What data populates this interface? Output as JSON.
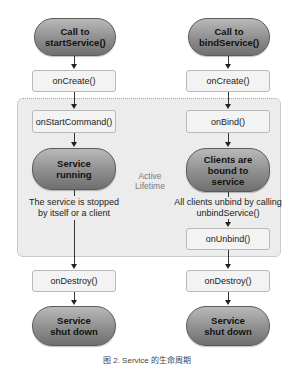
{
  "diagram": {
    "region_label": "Active\nLifetime",
    "left": {
      "start": "Call to startService()",
      "on_create": "onCreate()",
      "on_start_command": "onStartCommand()",
      "running": "Service running",
      "stop_note": "The service is stopped by itself or a client",
      "on_destroy": "onDestroy()",
      "shut_down": "Service shut down"
    },
    "right": {
      "start": "Call to bindService()",
      "on_create": "onCreate()",
      "on_bind": "onBind()",
      "bound": "Clients are bound to service",
      "unbind_note": "All clients unbind by calling unbindService()",
      "on_unbind": "onUnbind()",
      "on_destroy": "onDestroy()",
      "shut_down": "Service shut down"
    },
    "caption": "图 2. Service 的生命周期"
  }
}
